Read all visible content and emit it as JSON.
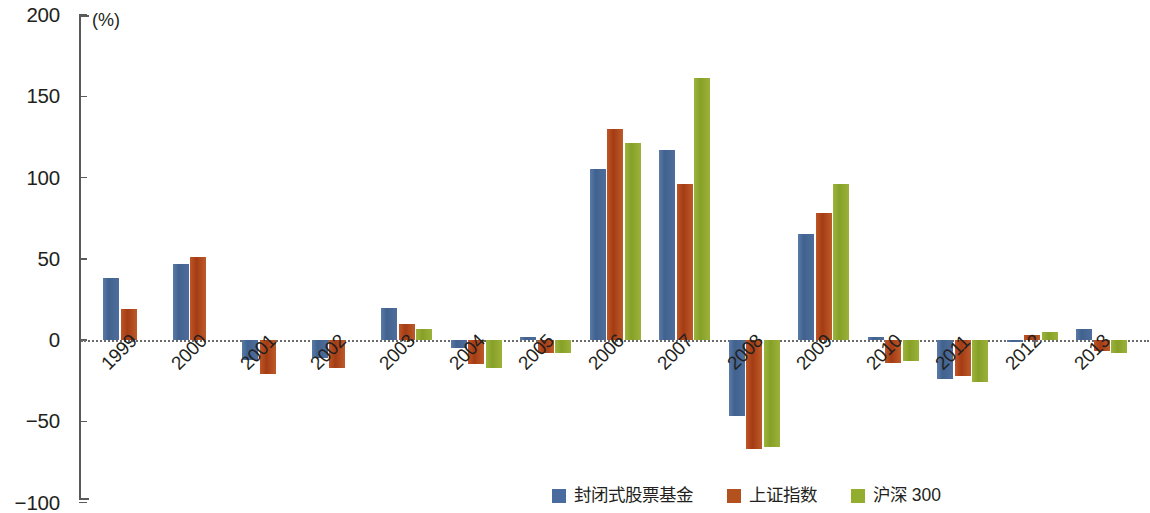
{
  "chart_data": {
    "type": "bar",
    "title": "",
    "subtitle": "",
    "unit_label": "(%)",
    "xlabel": "",
    "ylabel": "",
    "ylim": [
      -100,
      200
    ],
    "yticks": [
      200,
      150,
      100,
      50,
      0,
      -50,
      -100
    ],
    "ytick_labels": [
      "200",
      "150",
      "100",
      "50",
      "0",
      "−50",
      "−100"
    ],
    "grid": false,
    "legend_position": "bottom-right",
    "categories": [
      "1999",
      "2000",
      "2001",
      "2002",
      "2003",
      "2004",
      "2005",
      "2006",
      "2007",
      "2008",
      "2009",
      "2010",
      "2011",
      "2012",
      "2013"
    ],
    "series": [
      {
        "name": "封闭式股票基金",
        "color": "#4a6ba0",
        "values": [
          38,
          47,
          -12,
          -11,
          20,
          -5,
          2,
          105,
          117,
          -47,
          65,
          2,
          -24,
          -1,
          7
        ]
      },
      {
        "name": "上证指数",
        "color": "#b4521f",
        "values": [
          19,
          51,
          -21,
          -17,
          10,
          -15,
          -8,
          130,
          96,
          -67,
          78,
          -14,
          -22,
          3,
          -7
        ]
      },
      {
        "name": "沪深 300",
        "color": "#93ae2e",
        "values": [
          null,
          null,
          null,
          null,
          7,
          -17,
          -8,
          121,
          161,
          -66,
          96,
          -13,
          -26,
          5,
          -8
        ]
      }
    ]
  },
  "axis": {
    "unit": "(%)"
  },
  "legend": {
    "items": [
      {
        "label": "封闭式股票基金",
        "color": "#4a6ba0"
      },
      {
        "label": "上证指数",
        "color": "#b4521f"
      },
      {
        "label": "沪深 300",
        "color": "#93ae2e"
      }
    ]
  }
}
